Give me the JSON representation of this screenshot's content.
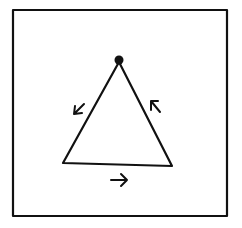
{
  "diagram": {
    "type": "triangle-cycle",
    "colors": {
      "ink": "#111111",
      "background": "#ffffff"
    },
    "frame": {
      "x": 13,
      "y": 10,
      "width": 214,
      "height": 206,
      "stroke_width": 2.2
    },
    "triangle": {
      "apex": [
        119,
        62
      ],
      "bottom_left": [
        63,
        163
      ],
      "bottom_right": [
        172,
        166
      ],
      "stroke_width": 2.2
    },
    "start_dot": {
      "cx": 119,
      "cy": 60,
      "r": 4.5
    },
    "arrows": [
      {
        "name": "left-side-arrow",
        "direction": "down-left",
        "path": "M84 104 L74 114 M74 114 L75 106 M74 114 L82 113"
      },
      {
        "name": "bottom-arrow",
        "direction": "right",
        "path": "M111 180 L127 180 M127 180 L121 174 M127 180 L121 186"
      },
      {
        "name": "right-side-arrow",
        "direction": "up-left",
        "path": "M160 112 L151 101 M151 101 L151 110 M151 101 L158 101"
      }
    ],
    "traversal": "counter-clockwise"
  }
}
